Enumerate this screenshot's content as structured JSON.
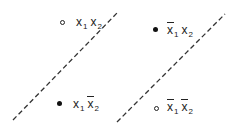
{
  "diagram": {
    "type": "boolean-function-separation",
    "lines": [
      {
        "id": "boundary-1",
        "style": "dashed",
        "from": [
          13,
          120
        ],
        "to": [
          118,
          12
        ]
      },
      {
        "id": "boundary-2",
        "style": "dashed",
        "from": [
          117,
          122
        ],
        "to": [
          225,
          14
        ]
      }
    ],
    "points": [
      {
        "id": "x1x2",
        "marker": "open",
        "vars": [
          {
            "name": "x",
            "sub": "1",
            "negated": false
          },
          {
            "name": "x",
            "sub": "2",
            "negated": false
          }
        ]
      },
      {
        "id": "notx1-x2",
        "marker": "filled",
        "vars": [
          {
            "name": "x",
            "sub": "1",
            "negated": true
          },
          {
            "name": "x",
            "sub": "2",
            "negated": false
          }
        ]
      },
      {
        "id": "x1-notx2",
        "marker": "filled",
        "vars": [
          {
            "name": "x",
            "sub": "1",
            "negated": false
          },
          {
            "name": "x",
            "sub": "2",
            "negated": true
          }
        ]
      },
      {
        "id": "notx1-notx2",
        "marker": "open",
        "vars": [
          {
            "name": "x",
            "sub": "1",
            "negated": true
          },
          {
            "name": "x",
            "sub": "2",
            "negated": true
          }
        ]
      }
    ]
  },
  "labels": {
    "tl": {
      "v1": "x",
      "s1": "1",
      "v2": "x",
      "s2": "2"
    },
    "tr": {
      "v1": "x",
      "s1": "1",
      "v2": "x",
      "s2": "2"
    },
    "bl": {
      "v1": "x",
      "s1": "1",
      "v2": "x",
      "s2": "2"
    },
    "br": {
      "v1": "x",
      "s1": "1",
      "v2": "x",
      "s2": "2"
    }
  },
  "colors": {
    "ink": "#222222",
    "background": "#ffffff"
  }
}
